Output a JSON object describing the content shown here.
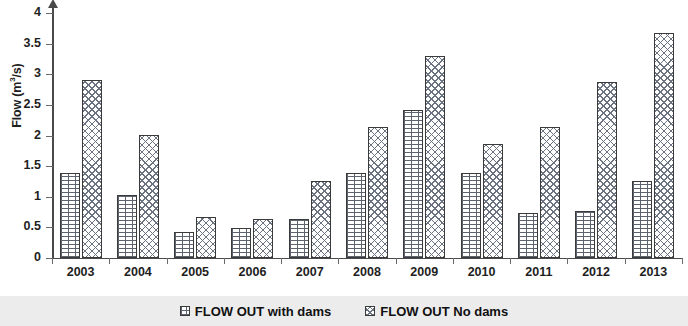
{
  "chart_data": {
    "type": "bar",
    "title": "",
    "xlabel": "",
    "ylabel": "Flow (m3/s)",
    "ylabel_html": "Flow (m<sup>3</sup>/s)",
    "ylim": [
      0,
      4
    ],
    "ytick_step": 0.5,
    "yticks": [
      "0",
      "0.5",
      "1",
      "1.5",
      "2",
      "2.5",
      "3",
      "3.5",
      "4"
    ],
    "grid": false,
    "legend_position": "bottom",
    "categories": [
      "2003",
      "2004",
      "2005",
      "2006",
      "2007",
      "2008",
      "2009",
      "2010",
      "2011",
      "2012",
      "2013"
    ],
    "series": [
      {
        "name": "FLOW OUT with dams",
        "pattern": "brick-hatch",
        "color": "#5d6470",
        "values": [
          1.38,
          1.03,
          0.42,
          0.49,
          0.63,
          1.39,
          2.41,
          1.38,
          0.73,
          0.76,
          1.25
        ]
      },
      {
        "name": "FLOW OUT No dams",
        "pattern": "diagonal-crosshatch",
        "color": "#6b7280",
        "values": [
          2.9,
          2.01,
          0.67,
          0.64,
          1.26,
          2.14,
          3.3,
          1.86,
          2.14,
          2.88,
          3.68
        ]
      }
    ]
  },
  "legend": {
    "items": [
      {
        "label": "FLOW OUT with dams"
      },
      {
        "label": "FLOW OUT No dams"
      }
    ]
  }
}
